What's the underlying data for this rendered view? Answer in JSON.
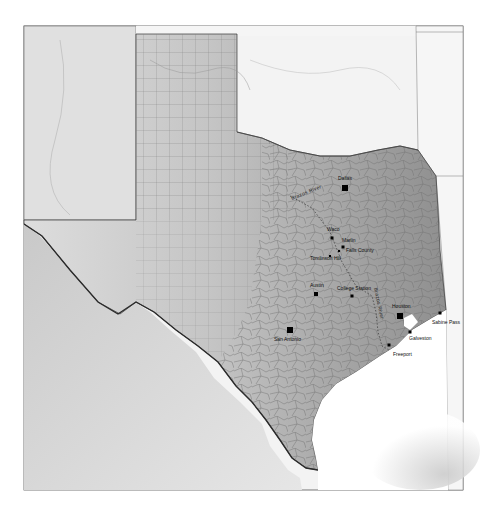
{
  "map": {
    "region": "Texas",
    "cities": [
      {
        "name": "Dallas",
        "x": 345,
        "y": 188,
        "size": 6,
        "label_x": 338,
        "label_y": 180
      },
      {
        "name": "Waco",
        "x": 332,
        "y": 238,
        "size": 3,
        "label_x": 327,
        "label_y": 231
      },
      {
        "name": "Marlin",
        "x": 343,
        "y": 247,
        "size": 3,
        "label_x": 342,
        "label_y": 242
      },
      {
        "name": "Falls County",
        "x": 339,
        "y": 251,
        "size": 2,
        "label_x": 346,
        "label_y": 252
      },
      {
        "name": "Tomlinson Hill",
        "x": 330,
        "y": 256,
        "size": 2,
        "label_x": 310,
        "label_y": 260
      },
      {
        "name": "Austin",
        "x": 316,
        "y": 294,
        "size": 4,
        "label_x": 310,
        "label_y": 287
      },
      {
        "name": "College Station",
        "x": 352,
        "y": 296,
        "size": 3,
        "label_x": 337,
        "label_y": 290
      },
      {
        "name": "Houston",
        "x": 400,
        "y": 316,
        "size": 6,
        "label_x": 392,
        "label_y": 308
      },
      {
        "name": "San Antonio",
        "x": 290,
        "y": 330,
        "size": 6,
        "label_x": 274,
        "label_y": 341
      },
      {
        "name": "Galveston",
        "x": 410,
        "y": 332,
        "size": 3,
        "label_x": 409,
        "label_y": 340
      },
      {
        "name": "Freeport",
        "x": 389,
        "y": 345,
        "size": 3,
        "label_x": 393,
        "label_y": 356
      },
      {
        "name": "Sabine Pass",
        "x": 440,
        "y": 313,
        "size": 3,
        "label_x": 432,
        "label_y": 324
      }
    ],
    "rivers": [
      {
        "name": "Brazos River",
        "label_placement": "curved near Dallas",
        "label_x": 292,
        "label_y": 200
      },
      {
        "name": "Brazos River",
        "label_placement": "vertical along river near College Station",
        "label_x": 376,
        "label_y": 288
      }
    ],
    "colors": {
      "background": "#ffffff",
      "frame": "#555555",
      "texas_fill_west": "#d8d8d8",
      "texas_fill_east": "#9a9a9a",
      "neighbor_fill": "#f2f2f2",
      "county_lines": "#777777",
      "rio_grande": "#333333",
      "gulf": "#ffffff",
      "gulf_shade": "#cfcfcf",
      "city_marker": "#000000",
      "label_text": "#111111"
    },
    "frame": {
      "x": 24,
      "y": 26,
      "width": 439,
      "height": 464
    }
  }
}
